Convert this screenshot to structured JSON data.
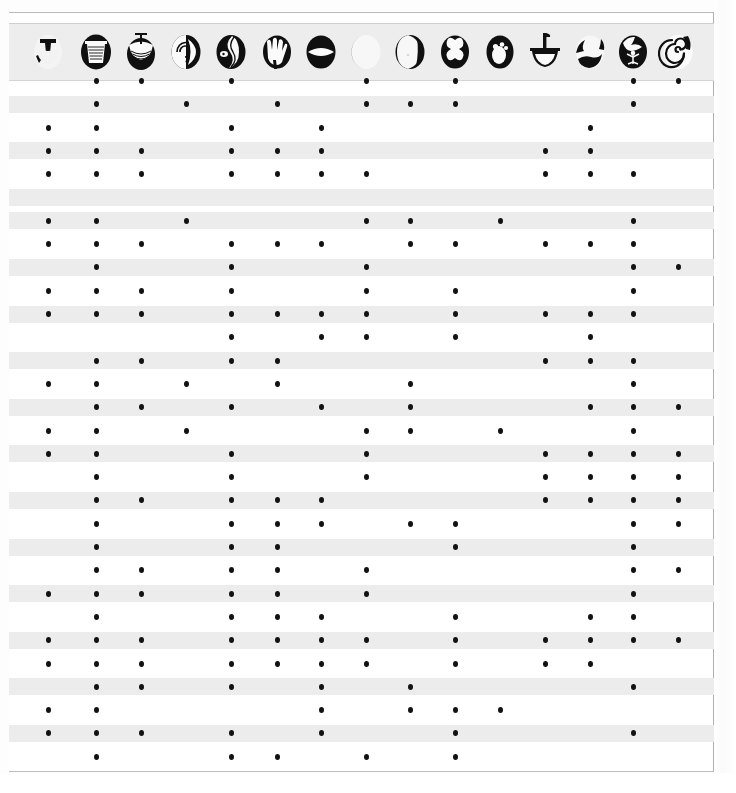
{
  "document": {
    "kind": "presence-absence-matrix",
    "description": "Scanned archaeological type/attribute matrix with pictographic column headers and filled-dot presence markers"
  },
  "colors": {
    "paper": "#fdfdfd",
    "sheet": "#ffffff",
    "band": "#ececec",
    "header_strip": "#ededed",
    "frame_border": "#b9b9b9",
    "dot": "#121212",
    "glyph_ink": "#101010"
  },
  "layout": {
    "frame": {
      "left": 9,
      "top": 12,
      "width": 705,
      "height": 760
    },
    "header": {
      "top": 10,
      "height": 56
    },
    "first_row_y": 80,
    "row_pitch": 23.3,
    "row_count": 30,
    "band_height": 17,
    "dot_size": 5
  },
  "columns": [
    {
      "index": 1,
      "x": 48,
      "icon": "vessel-open-bowl-icon",
      "label": "Open bowl"
    },
    {
      "index": 2,
      "x": 96,
      "icon": "vessel-beaker-icon",
      "label": "Beaker"
    },
    {
      "index": 3,
      "x": 141,
      "icon": "vessel-stemmed-cup-icon",
      "label": "Stemmed cup"
    },
    {
      "index": 4,
      "x": 186,
      "icon": "spiral-shell-icon",
      "label": "Spiral shell"
    },
    {
      "index": 5,
      "x": 231,
      "icon": "sinuous-serpent-icon",
      "label": "Sinuous serpent"
    },
    {
      "index": 6,
      "x": 277,
      "icon": "hand-print-icon",
      "label": "Hand print"
    },
    {
      "index": 7,
      "x": 321,
      "icon": "lens-eye-icon",
      "label": "Lens / eye"
    },
    {
      "index": 8,
      "x": 366,
      "icon": "crescent-disc-icon",
      "label": "Crescent disc"
    },
    {
      "index": 9,
      "x": 410,
      "icon": "split-circle-icon",
      "label": "Split circle"
    },
    {
      "index": 10,
      "x": 455,
      "icon": "quatrefoil-icon",
      "label": "Quatrefoil"
    },
    {
      "index": 11,
      "x": 500,
      "icon": "three-dot-ovoid-icon",
      "label": "Three-dot ovoid"
    },
    {
      "index": 12,
      "x": 545,
      "icon": "mortar-pestle-icon",
      "label": "Mortar and pestle"
    },
    {
      "index": 13,
      "x": 590,
      "icon": "lobed-blob-icon",
      "label": "Lobed form"
    },
    {
      "index": 14,
      "x": 633,
      "icon": "flower-sprig-icon",
      "label": "Flower sprig"
    },
    {
      "index": 15,
      "x": 678,
      "icon": "spiral-coil-icon",
      "label": "Spiral coil"
    }
  ],
  "rows": [
    {
      "index": 1,
      "banded": false,
      "cells": [
        0,
        1,
        1,
        0,
        1,
        0,
        0,
        1,
        0,
        1,
        0,
        0,
        0,
        1,
        1
      ]
    },
    {
      "index": 2,
      "banded": true,
      "cells": [
        0,
        1,
        0,
        1,
        0,
        1,
        0,
        1,
        1,
        1,
        0,
        0,
        0,
        1,
        0
      ]
    },
    {
      "index": 3,
      "banded": false,
      "cells": [
        1,
        1,
        0,
        0,
        1,
        0,
        1,
        0,
        0,
        0,
        0,
        0,
        1,
        0,
        0
      ]
    },
    {
      "index": 4,
      "banded": true,
      "cells": [
        1,
        1,
        1,
        0,
        1,
        1,
        1,
        0,
        0,
        0,
        0,
        1,
        1,
        0,
        0
      ]
    },
    {
      "index": 5,
      "banded": false,
      "cells": [
        1,
        1,
        1,
        0,
        1,
        1,
        1,
        1,
        0,
        0,
        0,
        1,
        1,
        1,
        0
      ]
    },
    {
      "index": 6,
      "banded": true,
      "cells": [
        0,
        0,
        0,
        0,
        0,
        0,
        0,
        0,
        0,
        0,
        0,
        0,
        0,
        0,
        0
      ]
    },
    {
      "index": 7,
      "banded": true,
      "cells": [
        1,
        1,
        0,
        1,
        0,
        0,
        0,
        1,
        1,
        0,
        1,
        0,
        0,
        1,
        0
      ]
    },
    {
      "index": 8,
      "banded": false,
      "cells": [
        1,
        1,
        1,
        0,
        1,
        1,
        1,
        0,
        1,
        1,
        0,
        1,
        1,
        1,
        0
      ]
    },
    {
      "index": 9,
      "banded": true,
      "cells": [
        0,
        1,
        0,
        0,
        1,
        0,
        0,
        1,
        0,
        0,
        0,
        0,
        0,
        1,
        1
      ]
    },
    {
      "index": 10,
      "banded": false,
      "cells": [
        1,
        1,
        1,
        0,
        1,
        0,
        0,
        1,
        0,
        1,
        0,
        0,
        0,
        1,
        0
      ]
    },
    {
      "index": 11,
      "banded": true,
      "cells": [
        1,
        1,
        1,
        0,
        1,
        1,
        1,
        1,
        0,
        1,
        0,
        1,
        1,
        1,
        0
      ]
    },
    {
      "index": 12,
      "banded": false,
      "cells": [
        0,
        0,
        0,
        0,
        1,
        0,
        1,
        1,
        0,
        1,
        0,
        0,
        1,
        0,
        0
      ]
    },
    {
      "index": 13,
      "banded": true,
      "cells": [
        0,
        1,
        1,
        0,
        1,
        1,
        0,
        0,
        0,
        0,
        0,
        1,
        1,
        1,
        0
      ]
    },
    {
      "index": 14,
      "banded": false,
      "cells": [
        1,
        1,
        0,
        1,
        0,
        1,
        0,
        0,
        1,
        0,
        0,
        0,
        0,
        1,
        0
      ]
    },
    {
      "index": 15,
      "banded": true,
      "cells": [
        0,
        1,
        1,
        0,
        1,
        0,
        1,
        0,
        1,
        0,
        0,
        0,
        1,
        1,
        1
      ]
    },
    {
      "index": 16,
      "banded": false,
      "cells": [
        1,
        1,
        0,
        1,
        0,
        0,
        0,
        1,
        1,
        0,
        1,
        0,
        0,
        1,
        0
      ]
    },
    {
      "index": 17,
      "banded": true,
      "cells": [
        1,
        1,
        0,
        0,
        1,
        0,
        0,
        1,
        0,
        0,
        0,
        1,
        1,
        1,
        1
      ]
    },
    {
      "index": 18,
      "banded": false,
      "cells": [
        0,
        1,
        0,
        0,
        1,
        0,
        0,
        1,
        0,
        0,
        0,
        1,
        1,
        1,
        1
      ]
    },
    {
      "index": 19,
      "banded": true,
      "cells": [
        0,
        1,
        1,
        0,
        1,
        1,
        1,
        0,
        0,
        0,
        0,
        1,
        1,
        1,
        1
      ]
    },
    {
      "index": 20,
      "banded": false,
      "cells": [
        0,
        1,
        0,
        0,
        1,
        1,
        1,
        0,
        1,
        1,
        0,
        0,
        0,
        1,
        1
      ]
    },
    {
      "index": 21,
      "banded": true,
      "cells": [
        0,
        1,
        0,
        0,
        1,
        1,
        0,
        0,
        0,
        1,
        0,
        0,
        0,
        1,
        0
      ]
    },
    {
      "index": 22,
      "banded": false,
      "cells": [
        0,
        1,
        1,
        0,
        1,
        1,
        0,
        1,
        0,
        0,
        0,
        0,
        0,
        1,
        1
      ]
    },
    {
      "index": 23,
      "banded": true,
      "cells": [
        1,
        1,
        1,
        0,
        1,
        1,
        0,
        1,
        0,
        0,
        0,
        0,
        0,
        1,
        0
      ]
    },
    {
      "index": 24,
      "banded": false,
      "cells": [
        0,
        1,
        0,
        0,
        1,
        1,
        1,
        0,
        0,
        1,
        0,
        0,
        1,
        1,
        0
      ]
    },
    {
      "index": 25,
      "banded": true,
      "cells": [
        1,
        1,
        1,
        0,
        1,
        1,
        1,
        1,
        0,
        1,
        0,
        1,
        1,
        1,
        1
      ]
    },
    {
      "index": 26,
      "banded": false,
      "cells": [
        1,
        1,
        1,
        0,
        1,
        1,
        1,
        1,
        0,
        1,
        0,
        1,
        1,
        0,
        0
      ]
    },
    {
      "index": 27,
      "banded": true,
      "cells": [
        0,
        1,
        1,
        0,
        1,
        0,
        1,
        0,
        1,
        0,
        0,
        0,
        0,
        1,
        0
      ]
    },
    {
      "index": 28,
      "banded": false,
      "cells": [
        1,
        1,
        0,
        0,
        0,
        0,
        1,
        0,
        1,
        1,
        1,
        0,
        0,
        0,
        0
      ]
    },
    {
      "index": 29,
      "banded": true,
      "cells": [
        1,
        1,
        1,
        0,
        1,
        0,
        1,
        0,
        0,
        1,
        0,
        0,
        0,
        1,
        0
      ]
    },
    {
      "index": 30,
      "banded": false,
      "cells": [
        0,
        1,
        0,
        0,
        1,
        1,
        0,
        1,
        0,
        1,
        0,
        0,
        0,
        0,
        0
      ]
    }
  ]
}
